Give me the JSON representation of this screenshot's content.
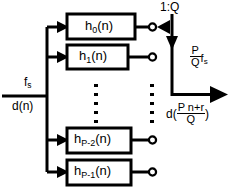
{
  "diagram": {
    "input": {
      "rate_label": "f",
      "rate_sub": "s",
      "signal_label": "d(n)"
    },
    "switch": {
      "ratio_label": "1:Q"
    },
    "output": {
      "rate_num": "P",
      "rate_den": "Q",
      "rate_fs": "f",
      "rate_fs_sub": "s",
      "signal_prefix": "d(",
      "signal_num": "P n+r",
      "signal_den": "Q",
      "signal_suffix": ")"
    },
    "branches": [
      {
        "name": "h0",
        "base": "h",
        "sub": "0",
        "arg": "(n)"
      },
      {
        "name": "h1",
        "base": "h",
        "sub": "1",
        "arg": "(n)"
      },
      {
        "name": "hPm2",
        "base": "h",
        "sub": "P-2",
        "arg": "(n)"
      },
      {
        "name": "hPm1",
        "base": "h",
        "sub": "P-1",
        "arg": "(n)"
      }
    ],
    "ellipsis": {
      "left_dots": 5,
      "right_dots": 5
    },
    "colors": {
      "stroke": "#000000",
      "background": "#ffffff",
      "box_fill": "#ffffff"
    }
  }
}
